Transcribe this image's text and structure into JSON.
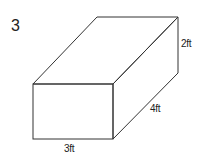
{
  "problem": {
    "number": "3"
  },
  "figure": {
    "shape": "rectangular-prism",
    "stroke_color": "#333333",
    "labels": {
      "height": "2ft",
      "depth": "4ft",
      "width": "3ft"
    },
    "vertices": {
      "front_top_left": [
        33,
        84
      ],
      "front_top_right": [
        113,
        84
      ],
      "front_bottom_left": [
        33,
        139
      ],
      "front_bottom_right": [
        113,
        139
      ],
      "back_top_left": [
        97,
        17
      ],
      "back_top_right": [
        178,
        17
      ],
      "back_bottom_right": [
        178,
        73
      ]
    }
  }
}
